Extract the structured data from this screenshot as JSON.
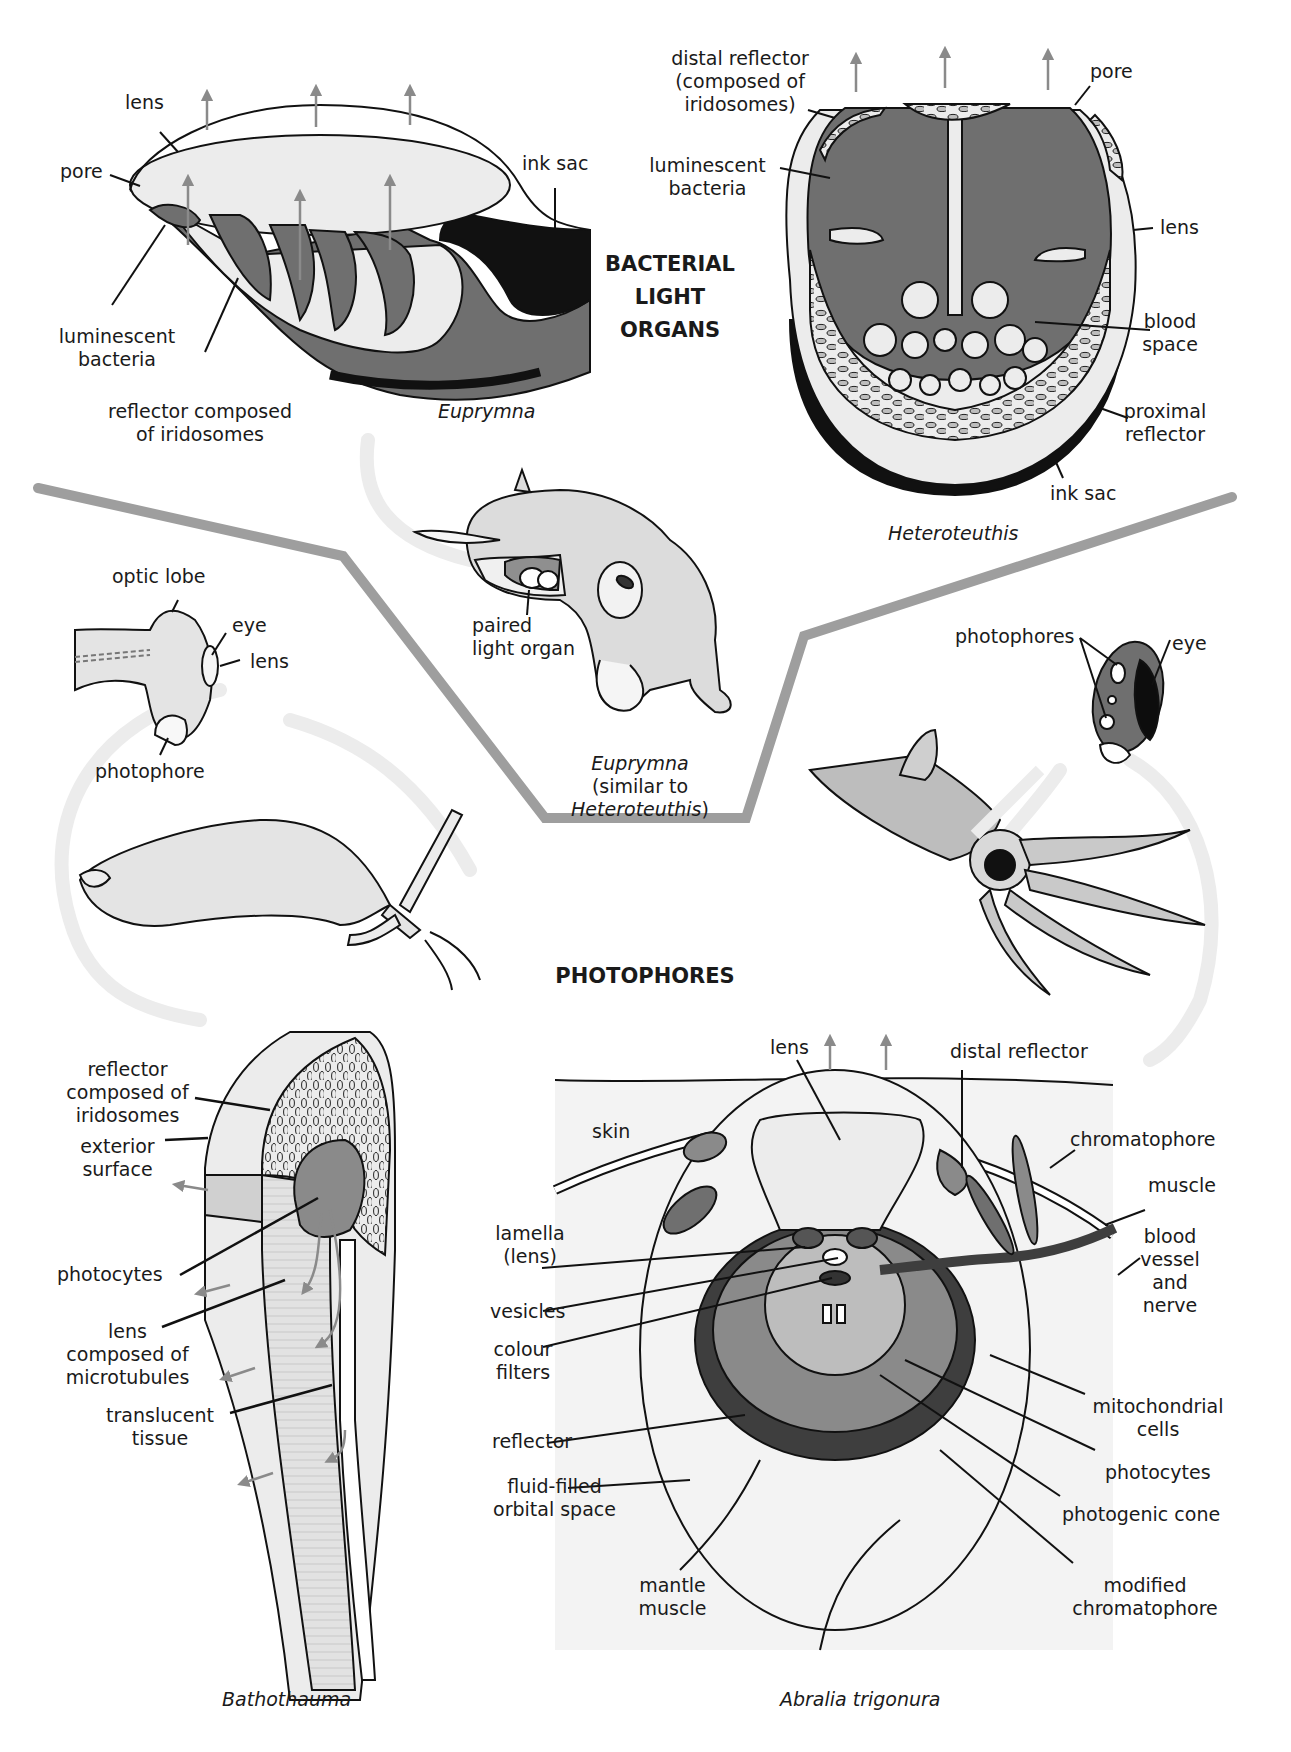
{
  "sections": {
    "bacterial": "BACTERIAL\nLIGHT\nORGANS",
    "photophores": "PHOTOPHORES"
  },
  "euprymna_organ": {
    "caption": "Euprymna",
    "labels": {
      "lens": "lens",
      "pore": "pore",
      "ink_sac": "ink sac",
      "bacteria": "luminescent\nbacteria",
      "reflector": "reflector composed\nof iridosomes"
    }
  },
  "heteroteuthis_organ": {
    "caption": "Heteroteuthis",
    "labels": {
      "distal_reflector": "distal reflector\n(composed of\niridosomes)",
      "pore": "pore",
      "bacteria": "luminescent\nbacteria",
      "lens": "lens",
      "blood_space": "blood\nspace",
      "proximal_reflector": "proximal\nreflector",
      "ink_sac": "ink sac"
    }
  },
  "euprymna_animal": {
    "paired_light_organ": "paired\nlight organ",
    "caption_1": "Euprymna",
    "caption_2": "(similar to",
    "caption_3": "Heteroteuthis",
    "caption_3_close": ")"
  },
  "bathothauma_head": {
    "labels": {
      "optic_lobe": "optic lobe",
      "eye": "eye",
      "lens": "lens",
      "photophore": "photophore"
    }
  },
  "abralia_head": {
    "labels": {
      "photophores": "photophores",
      "eye": "eye"
    }
  },
  "bathothauma_section": {
    "caption": "Bathothauma",
    "labels": {
      "reflector": "reflector\ncomposed of\niridosomes",
      "exterior": "exterior\nsurface",
      "photocytes": "photocytes",
      "lens": "lens\ncomposed of\nmicrotubules",
      "translucent": "translucent\ntissue"
    }
  },
  "abralia_section": {
    "caption": "Abralia trigonura",
    "labels": {
      "lens": "lens",
      "distal_reflector": "distal reflector",
      "skin": "skin",
      "chromatophore": "chromatophore",
      "muscle": "muscle",
      "lamella": "lamella\n(lens)",
      "vesicles": "vesicles",
      "colour_filters": "colour\nfilters",
      "blood_vessel": "blood\nvessel\nand\nnerve",
      "mitochondrial": "mitochondrial\ncells",
      "reflector": "reflector",
      "photocytes": "photocytes",
      "fluid_filled": "fluid-filled\norbital space",
      "photogenic_cone": "photogenic cone",
      "mantle_muscle": "mantle\nmuscle",
      "modified_chromatophore": "modified\nchromatophore"
    }
  },
  "colors": {
    "tissue_dark": "#6f6f6f",
    "tissue_light": "#ececec",
    "ink": "#111111",
    "light_arrow": "#8a8a8a",
    "divider": "#999999",
    "flow_arrow": "#e6e6e6"
  }
}
